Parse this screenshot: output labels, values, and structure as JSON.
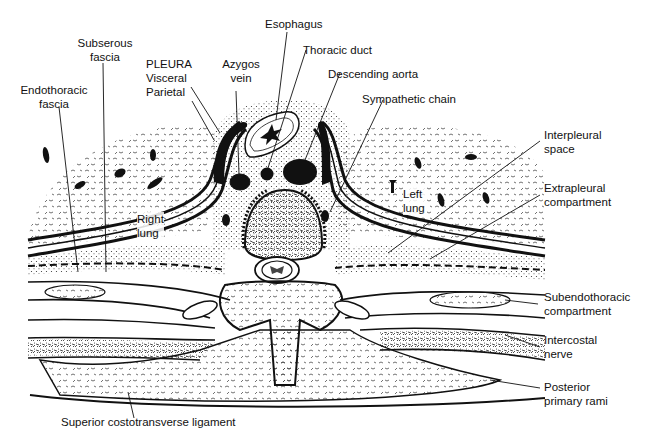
{
  "figure": {
    "labels": {
      "subserous_fascia": [
        "Subserous",
        "fascia"
      ],
      "endothoracic_fascia": [
        "Endothoracic",
        "fascia"
      ],
      "pleura": [
        "PLEURA",
        "Visceral",
        "Parietal"
      ],
      "azygos_vein": [
        "Azygos",
        "vein"
      ],
      "esophagus": [
        "Esophagus"
      ],
      "thoracic_duct": [
        "Thoracic duct"
      ],
      "descending_aorta": [
        "Descending aorta"
      ],
      "sympathetic_chain": [
        "Sympathetic chain"
      ],
      "interpleural_space": [
        "Interpleural",
        "space"
      ],
      "extrapleural_compartment": [
        "Extrapleural",
        "compartment"
      ],
      "subendothoracic_compartment": [
        "Subendothoracic",
        "compartment"
      ],
      "intercostal_nerve": [
        "Intercostal",
        "nerve"
      ],
      "posterior_primary_rami": [
        "Posterior",
        "primary rami"
      ],
      "superior_costotransverse_ligament": [
        "Superior costotransverse ligament"
      ],
      "right_lung": [
        "Right",
        "lung"
      ],
      "left_lung": [
        "Left",
        "lung"
      ]
    }
  },
  "colors": {
    "background": "#ffffff",
    "ink": "#111111",
    "stipple": "#333333"
  }
}
